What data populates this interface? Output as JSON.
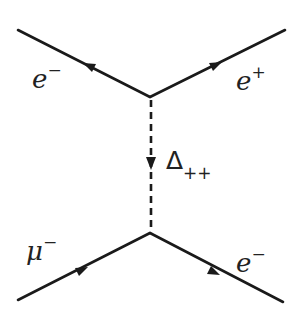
{
  "diagram": {
    "type": "feynman",
    "nodes": [
      {
        "id": "vertex_top",
        "x": 150,
        "y": 97
      },
      {
        "id": "vertex_bottom",
        "x": 150,
        "y": 233
      }
    ],
    "edges": [
      {
        "id": "e_minus_in",
        "label": "e",
        "charge": "−",
        "style": "solid",
        "from": [
          18,
          30
        ],
        "to": [
          150,
          97
        ],
        "arrow": "toward-external"
      },
      {
        "id": "e_plus_out",
        "label": "e",
        "charge": "+",
        "style": "solid",
        "from": [
          150,
          97
        ],
        "to": [
          285,
          30
        ],
        "arrow": "outgoing"
      },
      {
        "id": "delta_prop",
        "label": "Δ",
        "subscript": "++",
        "style": "dashed",
        "from": [
          150,
          97
        ],
        "to": [
          150,
          233
        ],
        "arrow": "down"
      },
      {
        "id": "mu_minus_in",
        "label": "μ",
        "charge": "−",
        "style": "solid",
        "from": [
          18,
          300
        ],
        "to": [
          150,
          233
        ],
        "arrow": "incoming"
      },
      {
        "id": "e_minus_out",
        "label": "e",
        "charge": "−",
        "style": "solid",
        "from": [
          150,
          233
        ],
        "to": [
          283,
          302
        ],
        "arrow": "outgoing"
      }
    ]
  },
  "labels": {
    "top_left": {
      "base": "e",
      "sup": "−"
    },
    "top_right": {
      "base": "e",
      "sup": "+"
    },
    "middle": {
      "base": "Δ",
      "sub": "++"
    },
    "bottom_left": {
      "base": "μ",
      "sup": "−"
    },
    "bottom_right": {
      "base": "e",
      "sup": "−"
    }
  },
  "colors": {
    "line": "#1a1a1a",
    "background": "#ffffff"
  }
}
